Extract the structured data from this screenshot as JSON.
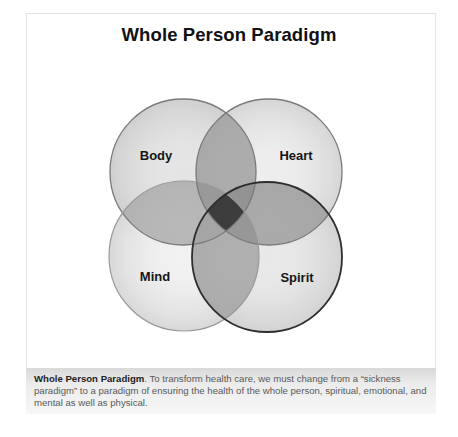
{
  "title": "Whole Person Paradigm",
  "diagram": {
    "type": "venn-4",
    "circles": [
      {
        "label": "Body",
        "cx": 183,
        "cy": 172,
        "r": 73,
        "label_x": 156,
        "label_y": 160
      },
      {
        "label": "Heart",
        "cx": 269,
        "cy": 172,
        "r": 73,
        "label_x": 296,
        "label_y": 160
      },
      {
        "label": "Mind",
        "cx": 184,
        "cy": 256,
        "r": 75,
        "label_x": 155,
        "label_y": 281
      },
      {
        "label": "Spirit",
        "cx": 267,
        "cy": 257,
        "r": 75,
        "label_x": 297,
        "label_y": 282
      }
    ],
    "colors": {
      "fill": "#8a8a8a",
      "stroke": "#6a6a6a",
      "spirit_stroke": "#3a3a3a",
      "center": "#3c3c3c"
    }
  },
  "caption": {
    "bold": "Whole Person Paradigm",
    "text": ". To transform health care, we must change from a “sickness paradigm” to a paradigm of ensuring the health of the whole person, spiritual, emotional, and mental as well as physical."
  }
}
